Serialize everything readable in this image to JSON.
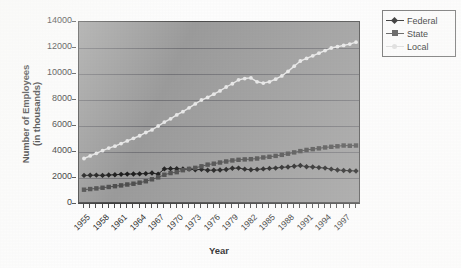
{
  "chart_data": {
    "type": "line",
    "title": "",
    "xlabel": "Year",
    "ylabel": "Number of Employees (in thousands)",
    "ylabel_line1": "Number of Employees",
    "ylabel_line2": "(in thousands)",
    "xlim": [
      1955,
      1999
    ],
    "ylim": [
      0,
      14000
    ],
    "ytick_step": 2000,
    "grid": true,
    "legend_position": "upper right",
    "yticks": [
      0,
      2000,
      4000,
      6000,
      8000,
      10000,
      12000,
      14000
    ],
    "ytick_labels": [
      "0",
      "2000",
      "4000",
      "6000",
      "8000",
      "10000",
      "12000",
      "14000"
    ],
    "x": [
      1955,
      1956,
      1957,
      1958,
      1959,
      1960,
      1961,
      1962,
      1963,
      1964,
      1965,
      1966,
      1967,
      1968,
      1969,
      1970,
      1971,
      1972,
      1973,
      1974,
      1975,
      1976,
      1977,
      1978,
      1979,
      1980,
      1981,
      1982,
      1983,
      1984,
      1985,
      1986,
      1987,
      1988,
      1989,
      1990,
      1991,
      1992,
      1993,
      1994,
      1995,
      1996,
      1997,
      1998,
      1999
    ],
    "xtick_labels": [
      "1955",
      "1958",
      "1961",
      "1964",
      "1967",
      "1970",
      "1973",
      "1976",
      "1979",
      "1982",
      "1985",
      "1988",
      "1991",
      "1994",
      "1997"
    ],
    "xtick_values": [
      1955,
      1958,
      1961,
      1964,
      1967,
      1970,
      1973,
      1976,
      1979,
      1982,
      1985,
      1988,
      1991,
      1994,
      1997
    ],
    "series": [
      {
        "name": "Federal",
        "color": "#1d1d1d",
        "marker": "diamond",
        "values": [
          2200,
          2210,
          2220,
          2200,
          2230,
          2250,
          2280,
          2300,
          2310,
          2320,
          2340,
          2380,
          2300,
          2700,
          2720,
          2720,
          2690,
          2680,
          2640,
          2660,
          2600,
          2600,
          2620,
          2650,
          2750,
          2760,
          2680,
          2640,
          2660,
          2700,
          2740,
          2760,
          2820,
          2850,
          2900,
          2960,
          2870,
          2850,
          2800,
          2760,
          2680,
          2620,
          2580,
          2560,
          2540
        ]
      },
      {
        "name": "State",
        "color": "#4e4e4e",
        "marker": "square",
        "values": [
          1100,
          1150,
          1200,
          1250,
          1310,
          1370,
          1430,
          1500,
          1560,
          1640,
          1750,
          1900,
          2050,
          2250,
          2380,
          2450,
          2600,
          2700,
          2780,
          2900,
          3030,
          3100,
          3190,
          3270,
          3350,
          3400,
          3430,
          3450,
          3500,
          3580,
          3630,
          3700,
          3780,
          3870,
          3970,
          4070,
          4160,
          4220,
          4280,
          4350,
          4400,
          4440,
          4500,
          4480,
          4500
        ]
      },
      {
        "name": "Local",
        "color": "#e8e8e8",
        "marker": "dot",
        "values": [
          3500,
          3700,
          3900,
          4100,
          4300,
          4450,
          4650,
          4850,
          5050,
          5250,
          5500,
          5700,
          6000,
          6300,
          6550,
          6850,
          7100,
          7400,
          7700,
          8000,
          8200,
          8450,
          8700,
          9000,
          9250,
          9550,
          9650,
          9700,
          9400,
          9300,
          9400,
          9600,
          9850,
          10200,
          10600,
          11000,
          11200,
          11400,
          11600,
          11800,
          12000,
          12100,
          12200,
          12300,
          12450
        ]
      }
    ]
  },
  "legend": {
    "items": [
      {
        "label": "Federal",
        "marker": "diamond",
        "color": "#1d1d1d"
      },
      {
        "label": "State",
        "marker": "square",
        "color": "#4e4e4e"
      },
      {
        "label": "Local",
        "marker": "dot",
        "color": "#dcdcdc"
      }
    ]
  },
  "axis": {
    "x_title": "Year",
    "y_title_line1": "Number of Employees",
    "y_title_line2": "(in thousands)"
  },
  "colors": {
    "plot_background": "#9b9b9b",
    "page_background": "#fdfdfd",
    "gridline": "#6f6f73",
    "axis": "#4c4c4c",
    "federal": "#1d1d1d",
    "state": "#4e4e4e",
    "local": "#e8e8e8"
  }
}
